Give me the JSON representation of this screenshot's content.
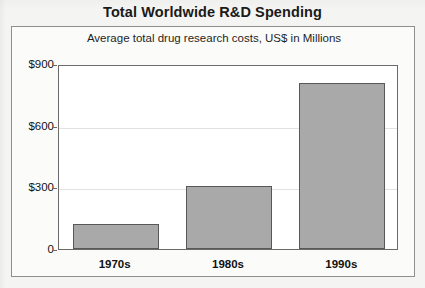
{
  "chart_data": {
    "type": "bar",
    "title": "Total Worldwide R&D Spending",
    "subtitle": "Average total drug research costs, US$ in Millions",
    "categories": [
      "1970s",
      "1980s",
      "1990s"
    ],
    "values": [
      120,
      305,
      810
    ],
    "series": [
      {
        "name": "Average total drug research costs",
        "values": [
          120,
          305,
          810
        ]
      }
    ],
    "xlabel": "",
    "ylabel": "",
    "ylim": [
      0,
      900
    ],
    "yticks": [
      0,
      300,
      600,
      900
    ],
    "ytick_labels": [
      "0",
      "$300",
      "$600",
      "$900"
    ],
    "grid": true,
    "legend": false,
    "bar_color": "#a9a9a9",
    "bar_border_color": "#585858",
    "plot_background": "#ffffff",
    "panel_background": "#fbfbfa",
    "page_background": "#f4f4f2",
    "gridline_color": "#e2e2e2",
    "axis_color": "#6a6a6a",
    "text_color": "#111111"
  }
}
